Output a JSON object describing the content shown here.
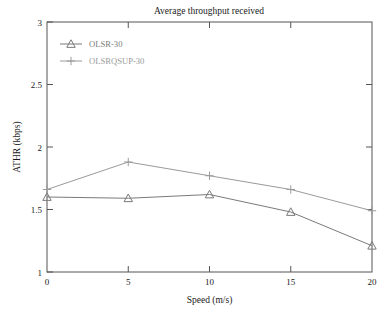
{
  "chart_data": {
    "type": "line",
    "title": "Average throughput received",
    "xlabel": "Speed (m/s)",
    "ylabel": "ATHR (kbps)",
    "x": [
      0,
      5,
      10,
      15,
      20
    ],
    "xlim": [
      0,
      20
    ],
    "ylim": [
      1,
      3
    ],
    "xticks": [
      "0",
      "5",
      "10",
      "15",
      "20"
    ],
    "yticks": [
      "1",
      "1.5",
      "2",
      "2.5",
      "3"
    ],
    "grid": false,
    "legend_position": "upper-left",
    "series": [
      {
        "name": "OLSR-30",
        "marker": "triangle",
        "color": "#7a7a7a",
        "values": [
          1.6,
          1.59,
          1.62,
          1.48,
          1.21
        ]
      },
      {
        "name": "OLSRQSUP-30",
        "marker": "plus",
        "color": "#9a9a9a",
        "values": [
          1.66,
          1.88,
          1.77,
          1.66,
          1.49
        ]
      }
    ]
  },
  "figure": {
    "title": "Average throughput received",
    "xlabel": "Speed (m/s)",
    "ylabel": "ATHR (kbps)",
    "xticks": [
      "0",
      "5",
      "10",
      "15",
      "20"
    ],
    "yticks": [
      "1",
      "1.5",
      "2",
      "2.5",
      "3"
    ],
    "legend": [
      {
        "label": "OLSR-30",
        "marker": "triangle-marker-icon"
      },
      {
        "label": "OLSRQSUP-30",
        "marker": "plus-marker-icon"
      }
    ],
    "colors": {
      "series_olsr": "#7a7a7a",
      "series_olsrqsup": "#9a9a9a",
      "frame": "#555555",
      "background": "#ffffff",
      "text": "#1a1a1a"
    }
  }
}
